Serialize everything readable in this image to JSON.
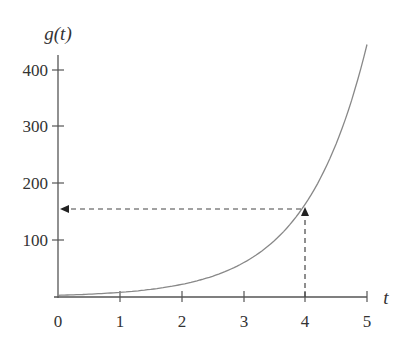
{
  "chart_data": {
    "type": "line",
    "title": "",
    "xlabel": "t",
    "ylabel": "g(t)",
    "xlim": [
      0,
      5
    ],
    "ylim": [
      0,
      430
    ],
    "x_ticks": [
      "0",
      "1",
      "2",
      "3",
      "4",
      "5"
    ],
    "y_ticks": [
      "100",
      "200",
      "300",
      "400"
    ],
    "grid": false,
    "legend": null,
    "series": [
      {
        "name": "g(t)",
        "x": [
          0,
          0.5,
          1,
          1.5,
          2,
          2.5,
          3,
          3.5,
          4,
          4.5,
          5
        ],
        "values": [
          3,
          5,
          8,
          13,
          22,
          37,
          60,
          99,
          164,
          270,
          445
        ]
      }
    ],
    "annotations": [
      {
        "type": "dashed-arrow",
        "from": [
          4,
          0
        ],
        "to": [
          4,
          155
        ],
        "direction": "up"
      },
      {
        "type": "dashed-arrow",
        "from": [
          4,
          155
        ],
        "to": [
          0,
          155
        ],
        "direction": "left"
      }
    ]
  },
  "labels": {
    "y_axis": "g(t)",
    "x_axis": "t",
    "x_ticks": [
      "0",
      "1",
      "2",
      "3",
      "4",
      "5"
    ],
    "y_ticks": [
      "100",
      "200",
      "300",
      "400"
    ]
  }
}
